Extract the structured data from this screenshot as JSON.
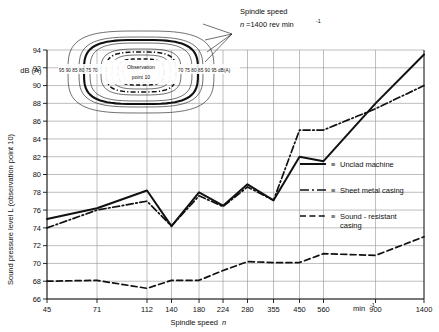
{
  "figure": {
    "background_color": "#ffffff",
    "ink_color": "#111111",
    "grid_color": "#9a9a9a"
  },
  "axes": {
    "y_title": "Sound pressure level L  (observation point 10)",
    "y_unit": "dB (A)",
    "y_ticks": [
      66,
      68,
      70,
      72,
      74,
      76,
      78,
      80,
      82,
      84,
      86,
      88,
      90,
      92,
      94
    ],
    "y_tick_labels": [
      "66",
      "68",
      "70",
      "72",
      "74",
      "76",
      "78",
      "80",
      "82",
      "84",
      "86",
      "88",
      "90",
      "92",
      "94"
    ],
    "y_min": 66,
    "y_max": 94,
    "x_title_main": "Spindle speed",
    "x_title_symbol": "n",
    "x_unit_label": "min",
    "x_unit_exponent": "-1",
    "x_ticks": [
      45,
      71,
      112,
      140,
      180,
      224,
      280,
      355,
      450,
      560,
      900,
      1400
    ],
    "x_tick_labels": [
      "45",
      "71",
      "112",
      "140",
      "180",
      "224",
      "280",
      "355",
      "450",
      "560",
      "900",
      "1400"
    ],
    "x_scale": "log"
  },
  "annotation": {
    "spindle_speed_line1": "Spindle speed",
    "spindle_speed_symbol": "n",
    "spindle_speed_value": "=1400 rev min",
    "spindle_speed_exponent": "-1"
  },
  "inset": {
    "center_label_line1": "Observation",
    "center_label_line2": "point 10",
    "scale_left": "95 90 85 80 75 70",
    "scale_right": "70 75 80 85 90 95 dB(A)"
  },
  "legend": {
    "separator": "≡",
    "items": [
      {
        "label": "Unclad machine",
        "style": "solid"
      },
      {
        "label": "Sheet metal casing",
        "style": "dash-dot"
      },
      {
        "label": "Sound - resistant",
        "label2": "casing",
        "style": "dashed"
      }
    ]
  },
  "chart_data": {
    "type": "line",
    "title": "",
    "xlabel": "Spindle speed n",
    "ylabel": "Sound pressure level L (observation point 10) dB (A)",
    "x_scale": "log",
    "xlim": [
      45,
      1400
    ],
    "ylim": [
      66,
      94
    ],
    "grid": true,
    "legend_position": "right-middle",
    "categories": [
      45,
      71,
      112,
      140,
      180,
      224,
      280,
      355,
      450,
      560,
      900,
      1400
    ],
    "series": [
      {
        "name": "Unclad machine",
        "style": "solid",
        "values": [
          75.0,
          76.2,
          78.2,
          74.2,
          78.0,
          76.5,
          78.9,
          77.1,
          82.0,
          81.5,
          88.0,
          93.5
        ]
      },
      {
        "name": "Sheet metal casing",
        "style": "dash-dot",
        "values": [
          74.0,
          76.0,
          77.0,
          74.2,
          77.6,
          76.4,
          78.6,
          77.1,
          85.0,
          85.0,
          87.4,
          90.0
        ]
      },
      {
        "name": "Sound - resistant casing",
        "style": "dashed",
        "values": [
          68.0,
          68.1,
          67.2,
          68.1,
          68.1,
          69.2,
          70.2,
          70.1,
          70.1,
          71.1,
          70.9,
          73.0
        ]
      }
    ]
  }
}
